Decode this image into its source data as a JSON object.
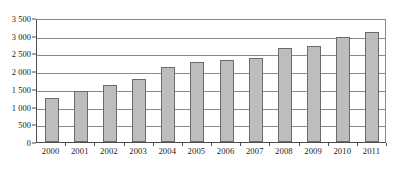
{
  "chart_data": {
    "type": "bar",
    "title": "",
    "xlabel": "",
    "ylabel": "",
    "categories": [
      "2000",
      "2001",
      "2002",
      "2003",
      "2004",
      "2005",
      "2006",
      "2007",
      "2008",
      "2009",
      "2010",
      "2011"
    ],
    "values": [
      1250,
      1430,
      1610,
      1790,
      2130,
      2250,
      2320,
      2380,
      2660,
      2720,
      2960,
      3100
    ],
    "ylim": [
      0,
      3500
    ],
    "y_ticks": [
      0,
      500,
      1000,
      1500,
      2000,
      2500,
      3000,
      3500
    ],
    "y_tick_labels": [
      "0",
      "500",
      "1 000",
      "1 500",
      "2 000",
      "2 500",
      "3 000",
      "3 500"
    ],
    "grid": true,
    "legend": null,
    "legend_position": "none",
    "series": [
      {
        "name": "",
        "values": [
          1250,
          1430,
          1610,
          1790,
          2130,
          2250,
          2320,
          2380,
          2660,
          2720,
          2960,
          3100
        ]
      }
    ]
  },
  "style": {
    "bar_fill": "#bdbdbd",
    "bar_border": "#6b6b6b",
    "grid_color": "#8a8a8a",
    "axis_color": "#4d4d4d",
    "background": "#ffffff",
    "text_color": "#1a1a1a"
  }
}
